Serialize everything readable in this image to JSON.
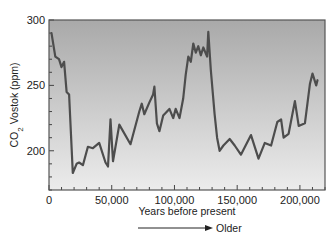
{
  "chart_data": {
    "type": "line",
    "title": "",
    "xlabel": "Years before present",
    "ylabel": "CO2 Vostok (ppm)",
    "ylabel_parts": {
      "prefix": "CO",
      "subscript": "2",
      "suffix": " Vostok (ppm)"
    },
    "annotation": "Older",
    "annotation_arrow": "right-arrow",
    "xlim": [
      0,
      220000
    ],
    "ylim": [
      170,
      300
    ],
    "x_ticks": [
      0,
      50000,
      100000,
      150000,
      200000
    ],
    "x_tick_labels": [
      "0",
      "50,000",
      "100,000",
      "150,000",
      "200,000"
    ],
    "x_minor_step": 10000,
    "y_ticks": [
      200,
      250,
      300
    ],
    "y_tick_labels": [
      "200",
      "250",
      "300"
    ],
    "y_minor_step": 10,
    "grid": false,
    "legend": null,
    "background_gradient": [
      "#a9a9a9",
      "#ececec"
    ],
    "line_color": "#4d4d4d",
    "series": [
      {
        "name": "CO2 Vostok",
        "x": [
          2000,
          5000,
          8000,
          10000,
          12000,
          14000,
          16000,
          19000,
          22000,
          24000,
          27000,
          31000,
          35000,
          40000,
          45000,
          47000,
          49000,
          51000,
          56000,
          65000,
          72000,
          74000,
          76000,
          80000,
          83000,
          84000,
          86000,
          88000,
          91000,
          96000,
          99000,
          101000,
          104000,
          107000,
          109000,
          111000,
          113000,
          115000,
          117000,
          119000,
          121000,
          123000,
          126000,
          127000,
          129000,
          132000,
          134000,
          136000,
          139000,
          144000,
          148000,
          153000,
          161000,
          167000,
          172000,
          177000,
          182000,
          185000,
          187000,
          191000,
          196000,
          199000,
          204000,
          208000,
          210000,
          213000,
          214000
        ],
        "values": [
          290,
          272,
          270,
          264,
          268,
          245,
          243,
          183,
          190,
          191,
          189,
          203,
          202,
          206,
          191,
          188,
          224,
          192,
          220,
          205,
          230,
          236,
          228,
          237,
          243,
          249,
          221,
          215,
          227,
          232,
          225,
          232,
          225,
          240,
          258,
          272,
          268,
          282,
          275,
          280,
          273,
          279,
          272,
          291,
          262,
          228,
          210,
          200,
          204,
          209,
          204,
          197,
          212,
          194,
          206,
          204,
          222,
          224,
          210,
          213,
          238,
          219,
          221,
          251,
          259,
          250,
          254
        ]
      }
    ]
  }
}
